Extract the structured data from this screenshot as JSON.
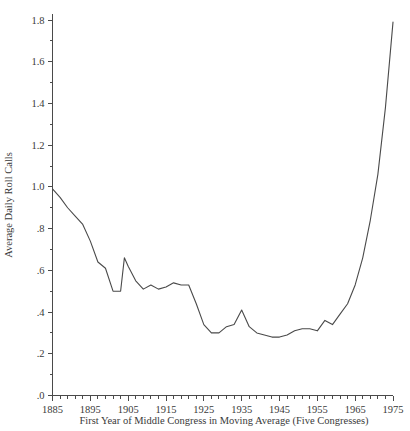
{
  "chart_data": {
    "type": "line",
    "title": "",
    "subtitle": "",
    "xlabel": "First Year of Middle Congress in Moving Average (Five Congresses)",
    "ylabel": "Average Daily Roll Calls",
    "xlim": [
      1885,
      1975
    ],
    "ylim": [
      0.0,
      1.8
    ],
    "grid": false,
    "legend": null,
    "x_tick_labels": [
      "1885",
      "1895",
      "1905",
      "1915",
      "1925",
      "1935",
      "1945",
      "1955",
      "1965",
      "1975"
    ],
    "x_tick_values": [
      1885,
      1895,
      1905,
      1915,
      1925,
      1935,
      1945,
      1955,
      1965,
      1975
    ],
    "x_minor_step": 2,
    "y_tick_labels": [
      ".0",
      ".2",
      ".4",
      ".6",
      ".8",
      "1.0",
      "1.2",
      "1.4",
      "1.6",
      "1.8"
    ],
    "y_tick_values": [
      0.0,
      0.2,
      0.4,
      0.6,
      0.8,
      1.0,
      1.2,
      1.4,
      1.6,
      1.8
    ],
    "y_minor_step": 0.1,
    "series": [
      {
        "name": "Average Daily Roll Calls",
        "color": "#4a4a4a",
        "x": [
          1885,
          1887,
          1889,
          1891,
          1893,
          1895,
          1897,
          1899,
          1901,
          1903,
          1904,
          1905,
          1907,
          1909,
          1911,
          1913,
          1915,
          1917,
          1919,
          1921,
          1923,
          1925,
          1927,
          1929,
          1931,
          1933,
          1935,
          1937,
          1939,
          1941,
          1943,
          1945,
          1947,
          1949,
          1951,
          1953,
          1955,
          1957,
          1959,
          1961,
          1963,
          1965,
          1967,
          1969,
          1971,
          1973,
          1975
        ],
        "y": [
          0.99,
          0.95,
          0.9,
          0.86,
          0.82,
          0.74,
          0.64,
          0.61,
          0.5,
          0.5,
          0.66,
          0.62,
          0.55,
          0.51,
          0.53,
          0.51,
          0.52,
          0.54,
          0.53,
          0.53,
          0.44,
          0.34,
          0.3,
          0.3,
          0.33,
          0.34,
          0.41,
          0.33,
          0.3,
          0.29,
          0.28,
          0.28,
          0.29,
          0.31,
          0.32,
          0.32,
          0.31,
          0.36,
          0.34,
          0.39,
          0.44,
          0.53,
          0.66,
          0.84,
          1.06,
          1.38,
          1.79
        ]
      }
    ]
  },
  "axes": {
    "y_axis_label": "Average Daily Roll Calls",
    "x_axis_label": "First Year of Middle Congress in Moving Average (Five Congresses)"
  }
}
